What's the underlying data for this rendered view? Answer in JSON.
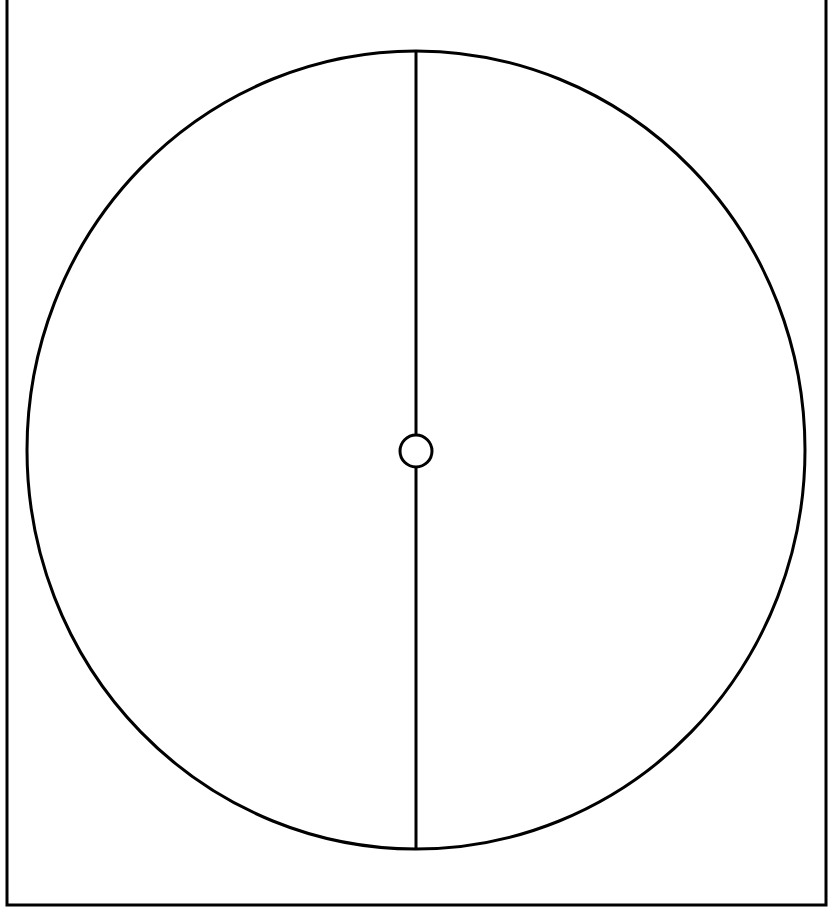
{
  "diagram": {
    "type": "circle-with-diameter",
    "frame": {
      "left": 7,
      "right": 826,
      "top": -5,
      "bottom": 905,
      "stroke": "#000000"
    },
    "circle": {
      "cx": 416,
      "cy": 450,
      "rx": 389,
      "ry": 399,
      "stroke": "#000000"
    },
    "diameter": {
      "x": 416,
      "y1": 51,
      "y2": 849
    },
    "center_marker": {
      "cx": 416,
      "cy": 451,
      "r": 16
    },
    "labels": []
  }
}
